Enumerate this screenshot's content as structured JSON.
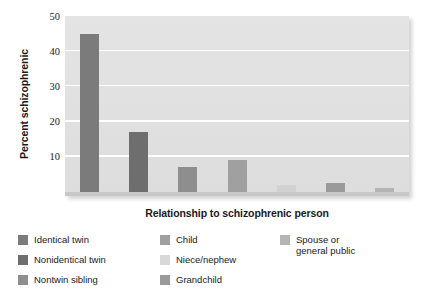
{
  "chart_data": {
    "type": "bar",
    "title": "",
    "xlabel": "Relationship to schizophrenic person",
    "ylabel": "Percent schizophrenic",
    "ylim": [
      0,
      50
    ],
    "yticks": [
      10,
      20,
      30,
      40,
      50
    ],
    "grid": true,
    "legend_position": "below",
    "categories": [
      "Identical twin",
      "Nonidentical twin",
      "Nontwin sibling",
      "Child",
      "Niece/nephew",
      "Grandchild",
      "Spouse or general public"
    ],
    "values": [
      45,
      17,
      7,
      9,
      2,
      2.5,
      1
    ],
    "bar_colors": [
      "#7b7b7b",
      "#6e6e6e",
      "#8e8e8e",
      "#a0a0a0",
      "#d2d2d2",
      "#9a9a9a",
      "#b4b4b4"
    ],
    "plot_background": "#e2e2e2",
    "gridline_color": "#ffffff"
  },
  "axis": {
    "y_title": "Percent schizophrenic",
    "x_title": "Relationship to schizophrenic person",
    "tick_50": "50",
    "tick_40": "40",
    "tick_30": "30",
    "tick_20": "20",
    "tick_10": "10"
  },
  "legend": {
    "columns": [
      {
        "items": [
          {
            "label": "Identical twin",
            "color": "#7b7b7b"
          },
          {
            "label": "Nonidentical twin",
            "color": "#6e6e6e"
          },
          {
            "label": "Nontwin sibling",
            "color": "#8e8e8e"
          }
        ]
      },
      {
        "items": [
          {
            "label": "Child",
            "color": "#a0a0a0"
          },
          {
            "label": "Niece/nephew",
            "color": "#d8d8d8"
          },
          {
            "label": "Grandchild",
            "color": "#9a9a9a"
          }
        ]
      },
      {
        "items": [
          {
            "label": "Spouse or\ngeneral public",
            "color": "#b4b4b4"
          }
        ]
      }
    ]
  }
}
